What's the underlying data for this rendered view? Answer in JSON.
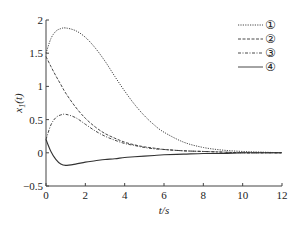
{
  "chart_data": {
    "type": "line",
    "title": "",
    "xlabel": "t/s",
    "ylabel": "x1(t)",
    "ylabel_main": "x",
    "ylabel_sub": "1",
    "ylabel_arg": "(t)",
    "xlim": [
      0,
      12
    ],
    "ylim": [
      -0.5,
      2
    ],
    "xticks": [
      0,
      2,
      4,
      6,
      8,
      10,
      12
    ],
    "yticks": [
      -0.5,
      0,
      0.5,
      1,
      1.5,
      2
    ],
    "xtick_labels": [
      "0",
      "2",
      "4",
      "6",
      "8",
      "10",
      "12"
    ],
    "ytick_labels": [
      "−0.5",
      "0",
      "0.5",
      "1",
      "1.5",
      "2"
    ],
    "grid": false,
    "legend_position": "upper right",
    "x": [
      0,
      0.25,
      0.5,
      0.75,
      1,
      1.5,
      2,
      2.5,
      3,
      3.5,
      4,
      4.5,
      5,
      5.5,
      6,
      7,
      8,
      9,
      10,
      11,
      12
    ],
    "series": [
      {
        "name": "①",
        "style": "dotted",
        "values": [
          1.5,
          1.72,
          1.83,
          1.87,
          1.88,
          1.84,
          1.74,
          1.58,
          1.38,
          1.15,
          0.93,
          0.73,
          0.56,
          0.42,
          0.31,
          0.16,
          0.08,
          0.04,
          0.02,
          0.01,
          0.0
        ]
      },
      {
        "name": "②",
        "style": "dashed",
        "values": [
          1.45,
          1.3,
          1.16,
          1.03,
          0.9,
          0.69,
          0.52,
          0.39,
          0.29,
          0.22,
          0.16,
          0.12,
          0.09,
          0.07,
          0.05,
          0.03,
          0.02,
          0.01,
          0.0,
          0.0,
          0.0
        ]
      },
      {
        "name": "③",
        "style": "dash-dot",
        "values": [
          0.2,
          0.42,
          0.53,
          0.57,
          0.58,
          0.53,
          0.43,
          0.33,
          0.25,
          0.19,
          0.14,
          0.11,
          0.08,
          0.06,
          0.05,
          0.03,
          0.02,
          0.01,
          0.0,
          0.0,
          0.0
        ]
      },
      {
        "name": "④",
        "style": "solid",
        "values": [
          0.2,
          0.02,
          -0.1,
          -0.17,
          -0.19,
          -0.17,
          -0.14,
          -0.12,
          -0.1,
          -0.09,
          -0.07,
          -0.06,
          -0.05,
          -0.04,
          -0.03,
          -0.02,
          -0.01,
          -0.01,
          0.0,
          0.0,
          0.0
        ]
      }
    ]
  },
  "legend": {
    "items": [
      {
        "label": "①",
        "style": "dotted"
      },
      {
        "label": "②",
        "style": "dashed"
      },
      {
        "label": "③",
        "style": "dash-dot"
      },
      {
        "label": "④",
        "style": "solid"
      }
    ]
  },
  "colors": {
    "line": "#333333",
    "axis": "#444444"
  }
}
